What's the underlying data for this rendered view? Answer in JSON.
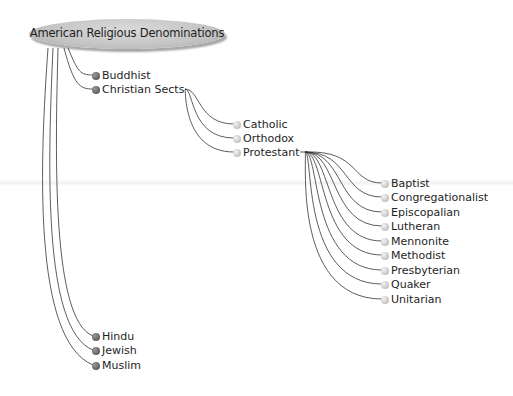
{
  "root": {
    "label": "American Religious Denominations"
  },
  "level1": [
    {
      "label": "Buddhist"
    },
    {
      "label": "Christian Sects"
    },
    {
      "label": "Hindu"
    },
    {
      "label": "Jewish"
    },
    {
      "label": "Muslim"
    }
  ],
  "christian_sects": [
    {
      "label": "Catholic"
    },
    {
      "label": "Orthodox"
    },
    {
      "label": "Protestant"
    }
  ],
  "protestant": [
    {
      "label": "Baptist"
    },
    {
      "label": "Congregationalist"
    },
    {
      "label": "Episcopalian"
    },
    {
      "label": "Lutheran"
    },
    {
      "label": "Mennonite"
    },
    {
      "label": "Methodist"
    },
    {
      "label": "Presbyterian"
    },
    {
      "label": "Quaker"
    },
    {
      "label": "Unitarian"
    }
  ],
  "colors": {
    "root_fill": "#c4c4c4",
    "dark_bullet": "#5e5e5e",
    "light_bullet": "#c2c2c2",
    "line": "#333333"
  }
}
